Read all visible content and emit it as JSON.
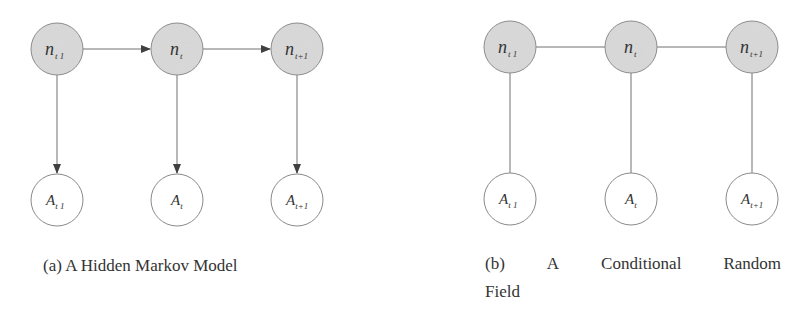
{
  "colors": {
    "hidden_fill": "#d9d9d9",
    "node_stroke": "#8a8a8a",
    "observed_fill": "#ffffff",
    "edge": "#707070"
  },
  "figures": [
    {
      "id": "a",
      "type": "directed",
      "caption": "(a) A Hidden Markov Model",
      "hidden_nodes": [
        {
          "base": "n",
          "sub": "t 1"
        },
        {
          "base": "n",
          "sub": "t"
        },
        {
          "base": "n",
          "sub": "t+1"
        }
      ],
      "observed_nodes": [
        {
          "base": "A",
          "sub": "t 1"
        },
        {
          "base": "A",
          "sub": "t"
        },
        {
          "base": "A",
          "sub": "t+1"
        }
      ]
    },
    {
      "id": "b",
      "type": "undirected",
      "caption_words": [
        "(b)",
        "A",
        "Conditional",
        "Random"
      ],
      "caption_line2": "Field",
      "hidden_nodes": [
        {
          "base": "n",
          "sub": "t 1"
        },
        {
          "base": "n",
          "sub": "t"
        },
        {
          "base": "n",
          "sub": "t+1"
        }
      ],
      "observed_nodes": [
        {
          "base": "A",
          "sub": "t 1"
        },
        {
          "base": "A",
          "sub": "t"
        },
        {
          "base": "A",
          "sub": "t+1"
        }
      ]
    }
  ]
}
